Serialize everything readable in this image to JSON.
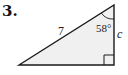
{
  "problem": {
    "number": "3."
  },
  "figure": {
    "type": "right-triangle",
    "hypotenuse_label": "7",
    "angle_label": "58°",
    "side_label": "c",
    "fill_color": "#f0f0f0",
    "stroke_color": "#1a1a1a"
  }
}
